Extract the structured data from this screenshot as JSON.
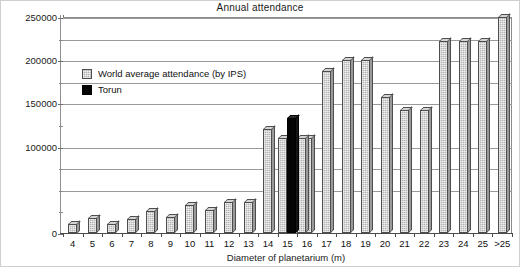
{
  "chart_data": {
    "type": "bar",
    "title": "Annual attendance",
    "xlabel": "Diameter of planetarium (m)",
    "ylabel": "",
    "ylim": [
      0,
      250000
    ],
    "grid": true,
    "legend_position": "upper-left-inside",
    "categories": [
      "4",
      "5",
      "6",
      "7",
      "8",
      "9",
      "10",
      "11",
      "12",
      "13",
      "14",
      "15",
      "16",
      "17",
      "18",
      "19",
      "20",
      "21",
      "22",
      "23",
      "24",
      "25",
      ">25"
    ],
    "y_ticks": [
      0,
      100000,
      150000,
      200000,
      250000
    ],
    "y_tick_labels": [
      "0",
      "100000",
      "150000",
      "200000",
      "250000"
    ],
    "y_gridlines": [
      50000,
      75000,
      100000,
      150000,
      175000,
      200000,
      225000,
      250000
    ],
    "series": [
      {
        "name": "World average attendance (by IPS)",
        "color": "#b4b4b4",
        "values": [
          11000,
          17000,
          10000,
          16000,
          25000,
          18000,
          32000,
          27000,
          36000,
          36000,
          120000,
          110000,
          110000,
          188000,
          200000,
          200000,
          157000,
          142000,
          142000,
          222000,
          222000,
          222000,
          250000
        ]
      },
      {
        "name": "Torun",
        "color": "#050505",
        "values": [
          null,
          null,
          null,
          null,
          null,
          null,
          null,
          null,
          null,
          null,
          null,
          133000,
          null,
          null,
          null,
          null,
          null,
          null,
          null,
          null,
          null,
          null,
          null
        ]
      }
    ]
  },
  "legend": {
    "items": [
      {
        "label": "World average attendance (by IPS)",
        "swatch": "ips"
      },
      {
        "label": "Torun",
        "swatch": "torun"
      }
    ]
  },
  "axes": {
    "y_title": "",
    "x_title": "Diameter of planetarium (m)"
  }
}
